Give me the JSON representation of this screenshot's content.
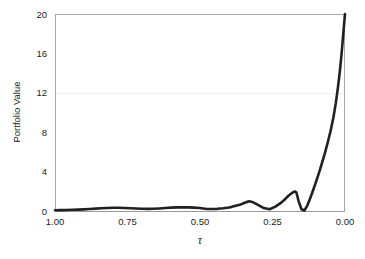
{
  "chart_data": {
    "type": "line",
    "title": "",
    "xlabel": "τ",
    "ylabel": "Portfolio Value",
    "xlim": [
      1.0,
      0.0
    ],
    "ylim": [
      0,
      20
    ],
    "x_reversed": true,
    "grid": "faint horizontal gridline at y=12",
    "legend": null,
    "xticks": [
      "1.00",
      "0.75",
      "0.50",
      "0.25",
      "0.00"
    ],
    "xtick_values": [
      1.0,
      0.75,
      0.5,
      0.25,
      0.0
    ],
    "yticks": [
      "0",
      "4",
      "8",
      "12",
      "16",
      "20"
    ],
    "ytick_values": [
      0,
      4,
      8,
      12,
      16,
      20
    ],
    "series": [
      {
        "name": "Portfolio Value",
        "color": "#231f20",
        "x": [
          1.0,
          0.98,
          0.96,
          0.94,
          0.92,
          0.9,
          0.88,
          0.86,
          0.84,
          0.82,
          0.8,
          0.78,
          0.76,
          0.74,
          0.72,
          0.7,
          0.68,
          0.66,
          0.64,
          0.62,
          0.6,
          0.58,
          0.56,
          0.54,
          0.52,
          0.5,
          0.49,
          0.48,
          0.46,
          0.44,
          0.42,
          0.4,
          0.39,
          0.38,
          0.37,
          0.36,
          0.355,
          0.35,
          0.345,
          0.34,
          0.33,
          0.32,
          0.3,
          0.28,
          0.26,
          0.24,
          0.22,
          0.205,
          0.195,
          0.185,
          0.178,
          0.172,
          0.168,
          0.165,
          0.16,
          0.15,
          0.14,
          0.13,
          0.12,
          0.11,
          0.1,
          0.09,
          0.08,
          0.07,
          0.06,
          0.05,
          0.04,
          0.032,
          0.025,
          0.018,
          0.012,
          0.007,
          0.003,
          0.0
        ],
        "y": [
          0.08,
          0.09,
          0.1,
          0.12,
          0.14,
          0.17,
          0.2,
          0.24,
          0.28,
          0.31,
          0.33,
          0.33,
          0.31,
          0.28,
          0.25,
          0.23,
          0.22,
          0.23,
          0.26,
          0.3,
          0.34,
          0.37,
          0.38,
          0.37,
          0.34,
          0.3,
          0.26,
          0.22,
          0.2,
          0.22,
          0.28,
          0.36,
          0.42,
          0.5,
          0.58,
          0.66,
          0.72,
          0.78,
          0.84,
          0.9,
          0.98,
          0.92,
          0.62,
          0.3,
          0.18,
          0.45,
          0.85,
          1.25,
          1.55,
          1.78,
          1.92,
          1.98,
          1.9,
          1.6,
          1.0,
          0.18,
          0.05,
          0.55,
          1.3,
          2.1,
          2.95,
          3.85,
          4.8,
          5.8,
          6.9,
          8.1,
          9.5,
          10.9,
          12.4,
          14.1,
          15.9,
          17.6,
          19.0,
          20.0
        ]
      }
    ]
  },
  "axes": {
    "ylabel_text": "Portfolio Value",
    "xlabel_text": "τ"
  },
  "colors": {
    "curve": "#231f20",
    "frame": "#a8a8a8",
    "grid": "#f0f0f0",
    "background": "#ffffff",
    "text": "#1c1c1c"
  }
}
